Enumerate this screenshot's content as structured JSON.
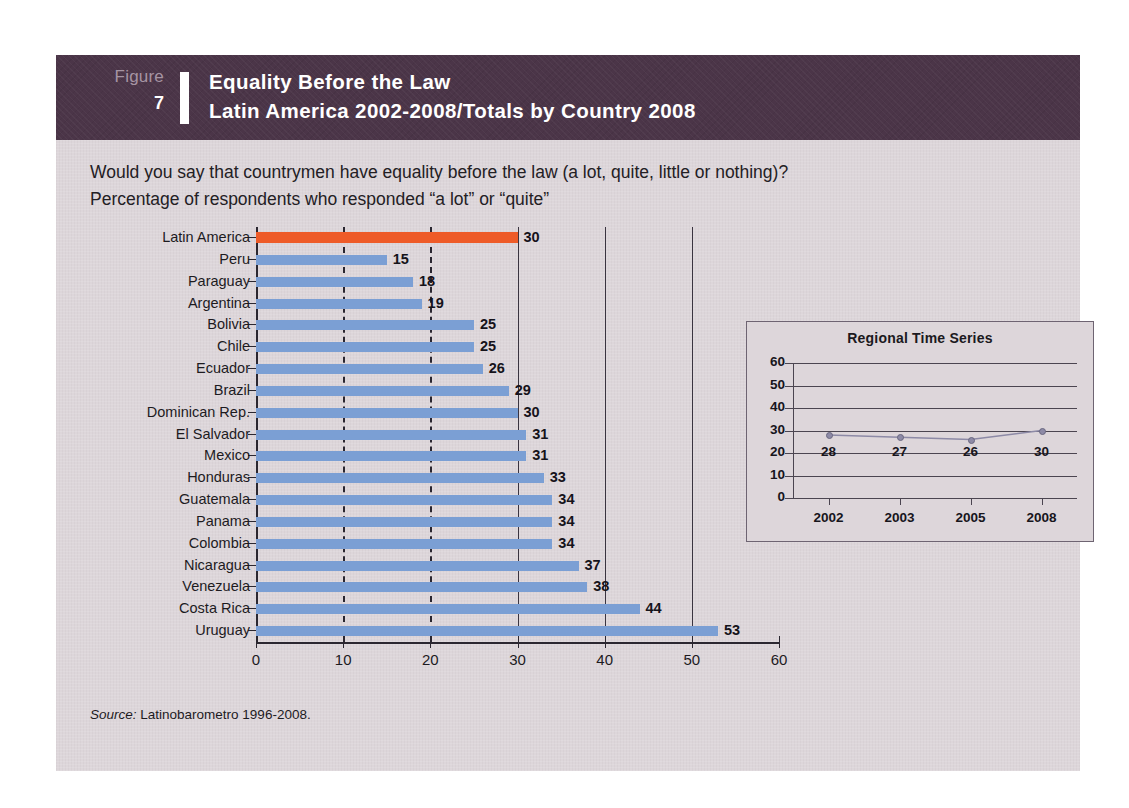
{
  "figure": {
    "label": "Figure",
    "number": "7",
    "title_line1": "Equality Before the Law",
    "title_line2": "Latin America 2002-2008/Totals by Country 2008"
  },
  "question": {
    "line1": "Would you say that countrymen have equality before the law (a lot, quite, little or nothing)?",
    "line2": "Percentage of respondents who responded “a lot” or “quite”"
  },
  "source": {
    "prefix": "Source:",
    "text": "Latinobarometro 1996-2008."
  },
  "colors": {
    "header_band": "#4b3548",
    "card_background": "#ddd6da",
    "bar_blue": "#7b9fd4",
    "bar_highlight_orange": "#ee5b28",
    "axis": "#2b2730"
  },
  "chart_data": {
    "type": "bar",
    "orientation": "horizontal",
    "title": "Equality Before the Law",
    "subtitle": "Latin America 2002-2008/Totals by Country 2008",
    "xlabel": "",
    "ylabel": "",
    "xlim": [
      0,
      60
    ],
    "xticks": [
      0,
      10,
      20,
      30,
      40,
      50,
      60
    ],
    "grid": true,
    "legend": false,
    "highlight_category": "Latin America",
    "categories": [
      "Latin America",
      "Peru",
      "Paraguay",
      "Argentina",
      "Bolivia",
      "Chile",
      "Ecuador",
      "Brazil",
      "Dominican Rep.",
      "El Salvador",
      "Mexico",
      "Honduras",
      "Guatemala",
      "Panama",
      "Colombia",
      "Nicaragua",
      "Venezuela",
      "Costa Rica",
      "Uruguay"
    ],
    "values": [
      30,
      15,
      18,
      19,
      25,
      25,
      26,
      29,
      30,
      31,
      31,
      33,
      34,
      34,
      34,
      37,
      38,
      44,
      53
    ]
  },
  "inset_chart": {
    "type": "line",
    "title": "Regional Time Series",
    "categories": [
      "2002",
      "2003",
      "2005",
      "2008"
    ],
    "values": [
      28,
      27,
      26,
      30
    ],
    "ylim": [
      0,
      60
    ],
    "yticks": [
      60,
      50,
      40,
      30,
      20,
      10,
      0
    ],
    "grid": true,
    "legend": false
  }
}
